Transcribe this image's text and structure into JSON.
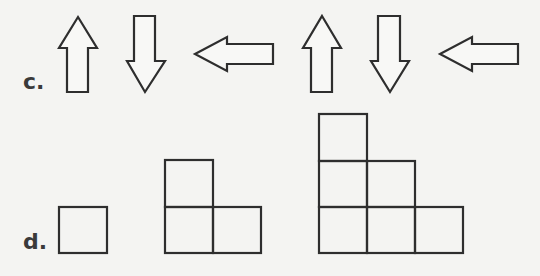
{
  "rows": [
    {
      "label": "c.",
      "description": "Pattern of arrows",
      "items": [
        {
          "type": "arrow",
          "direction": "up"
        },
        {
          "type": "arrow",
          "direction": "down"
        },
        {
          "type": "arrow",
          "direction": "left"
        },
        {
          "type": "arrow",
          "direction": "up"
        },
        {
          "type": "arrow",
          "direction": "down"
        },
        {
          "type": "arrow",
          "direction": "left"
        }
      ]
    },
    {
      "label": "d.",
      "description": "Growing staircase of squares",
      "items": [
        {
          "type": "square-staircase",
          "steps": 1,
          "squares": 1
        },
        {
          "type": "square-staircase",
          "steps": 2,
          "squares": 3
        },
        {
          "type": "square-staircase",
          "steps": 3,
          "squares": 6
        }
      ]
    }
  ],
  "colors": {
    "stroke": "#2e2e2e",
    "background": "#f4f4f2",
    "label": "#3a3a3a"
  }
}
